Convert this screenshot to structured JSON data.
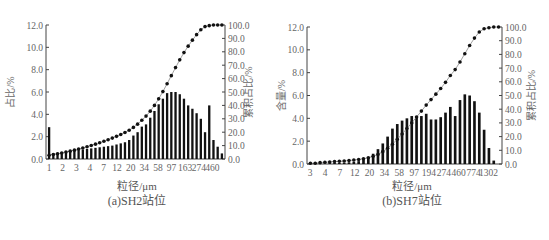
{
  "chart_data": [
    {
      "id": "sh2",
      "type": "bar+line",
      "title": "(a)SH2站位",
      "xlabel": "粒径/μm",
      "ylabel": "占比/%",
      "y2label": "累积占比/%",
      "ylim": [
        0,
        12
      ],
      "y2lim": [
        0,
        100
      ],
      "yticks": [
        "0.0",
        "2.0",
        "4.0",
        "6.0",
        "8.0",
        "10.0",
        "12.0"
      ],
      "y2ticks": [
        "0.0",
        "10.0",
        "20.0",
        "30.0",
        "40.0",
        "50.0",
        "60.0",
        "70.0",
        "80.0",
        "90.0",
        "100.0"
      ],
      "xtick_labels": [
        "1",
        "2",
        "3",
        "4",
        "7",
        "12",
        "20",
        "34",
        "58",
        "97",
        "163",
        "274",
        "460"
      ],
      "grid": false,
      "bar_values": [
        2.85,
        0.5,
        0.55,
        0.6,
        0.65,
        0.7,
        0.75,
        0.8,
        0.85,
        0.9,
        0.95,
        1.0,
        1.05,
        1.1,
        1.15,
        1.2,
        1.3,
        1.4,
        1.5,
        1.7,
        2.1,
        2.4,
        2.9,
        3.1,
        3.7,
        4.3,
        4.9,
        5.4,
        5.9,
        6.0,
        6.0,
        5.8,
        5.4,
        4.8,
        4.5,
        4.1,
        3.6,
        2.4,
        4.8,
        1.7,
        1.1,
        0.5
      ],
      "cumulative_values": [
        2.85,
        3.35,
        3.9,
        4.5,
        5.15,
        5.85,
        6.6,
        7.4,
        8.25,
        9.15,
        10.1,
        11.1,
        12.15,
        13.25,
        14.4,
        15.6,
        16.9,
        18.3,
        19.8,
        21.5,
        23.6,
        26.0,
        28.9,
        32.0,
        35.7,
        40.0,
        44.9,
        50.3,
        56.2,
        62.2,
        68.2,
        74.0,
        79.4,
        84.2,
        88.7,
        92.8,
        96.4,
        98.8,
        99.5,
        100.0,
        100.0,
        100.0
      ]
    },
    {
      "id": "sh7",
      "type": "bar+line",
      "title": "(b)SH7站位",
      "xlabel": "粒径/μm",
      "ylabel": "含量/%",
      "y2label": "累积占比/%",
      "ylim": [
        0,
        12
      ],
      "y2lim": [
        0,
        100
      ],
      "yticks": [
        "0.0",
        "2.0",
        "4.0",
        "6.0",
        "8.0",
        "10.0",
        "12.0"
      ],
      "y2ticks": [
        "0.0",
        "10.0",
        "20.0",
        "30.0",
        "40.0",
        "50.0",
        "60.0",
        "70.0",
        "80.0",
        "90.0",
        "100.0"
      ],
      "xtick_labels": [
        "3",
        "4",
        "7",
        "12",
        "20",
        "34",
        "58",
        "97",
        "194",
        "274",
        "460",
        "774",
        "1302"
      ],
      "grid": false,
      "bar_values": [
        0.05,
        0.05,
        0.05,
        0.05,
        0.08,
        0.1,
        0.1,
        0.12,
        0.15,
        0.2,
        0.25,
        0.35,
        0.6,
        0.9,
        1.3,
        1.8,
        2.4,
        3.1,
        3.5,
        3.8,
        4.0,
        4.2,
        4.2,
        4.2,
        4.4,
        3.9,
        3.9,
        4.1,
        4.5,
        5.0,
        4.2,
        5.6,
        6.1,
        6.0,
        5.5,
        4.5,
        3.0,
        1.4,
        0.3,
        0.0
      ],
      "cumulative_values": [
        0.5,
        0.6,
        1.0,
        1.3,
        1.5,
        1.8,
        2.0,
        2.2,
        2.5,
        2.9,
        3.3,
        3.8,
        4.6,
        5.6,
        7.0,
        9.0,
        11.5,
        14.5,
        18.0,
        21.9,
        25.9,
        30.0,
        34.3,
        38.6,
        43.0,
        47.0,
        51.0,
        55.1,
        59.6,
        64.6,
        68.9,
        74.5,
        80.5,
        86.5,
        91.9,
        96.4,
        98.7,
        99.5,
        100.0,
        100.0
      ]
    }
  ]
}
